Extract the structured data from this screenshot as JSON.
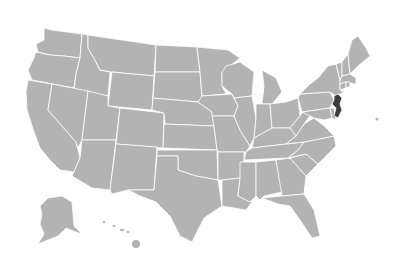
{
  "map": {
    "title": "United States",
    "colors": {
      "base": "#b3b3b3",
      "highlight": "#3d3d3d",
      "border": "#ffffff",
      "background": "#ffffff"
    },
    "highlighted_state": "New Jersey",
    "states": [
      {
        "name": "Washington",
        "points": "44,28 52,30 82,34 80,58 64,56 50,55 38,52 36,44 44,40"
      },
      {
        "name": "Oregon",
        "points": "36,52 50,55 64,56 80,58 76,74 74,88 32,80 28,70 33,60"
      },
      {
        "name": "California",
        "points": "28,80 52,84 48,110 76,142 80,158 74,172 60,170 50,160 40,148 34,132 27,110 26,92"
      },
      {
        "name": "Idaho",
        "points": "82,34 88,35 88,48 96,62 100,70 110,72 108,96 74,90 76,74 80,58"
      },
      {
        "name": "Nevada",
        "points": "52,84 88,91 82,140 78,148 76,142 48,110"
      },
      {
        "name": "Montana",
        "points": "88,35 156,45 154,76 112,72 100,70 96,62 88,48"
      },
      {
        "name": "Wyoming",
        "points": "112,72 154,76 152,110 108,106"
      },
      {
        "name": "Utah",
        "points": "88,91 108,96 108,106 120,108 116,140 82,140"
      },
      {
        "name": "Arizona",
        "points": "82,140 116,140 110,190 92,188 72,176 80,158"
      },
      {
        "name": "Colorado",
        "points": "120,108 164,113 163,148 116,144"
      },
      {
        "name": "New Mexico",
        "points": "116,144 157,147 154,190 128,190 112,194 110,190"
      },
      {
        "name": "North Dakota",
        "points": "156,45 197,47 200,72 155,72"
      },
      {
        "name": "South Dakota",
        "points": "155,72 200,72 202,98 198,102 153,98"
      },
      {
        "name": "Nebraska",
        "points": "153,98 198,102 212,112 214,126 165,124 164,113 152,110"
      },
      {
        "name": "Kansas",
        "points": "164,124 214,126 217,150 163,148"
      },
      {
        "name": "Oklahoma",
        "points": "157,150 217,150 218,180 196,176 178,170 178,156 157,156"
      },
      {
        "name": "Texas",
        "points": "157,156 178,156 178,170 196,176 218,180 222,206 204,218 192,242 180,236 170,216 156,202 140,196 128,190 154,190"
      },
      {
        "name": "Minnesota",
        "points": "197,47 228,50 240,58 222,72 222,86 226,94 202,96 200,72"
      },
      {
        "name": "Iowa",
        "points": "202,96 232,94 238,106 234,116 212,116 212,112 198,102"
      },
      {
        "name": "Missouri",
        "points": "212,116 234,116 240,130 250,146 246,152 218,152 217,150 214,126"
      },
      {
        "name": "Arkansas",
        "points": "218,152 244,152 244,160 240,178 222,180 218,180"
      },
      {
        "name": "Louisiana",
        "points": "222,180 240,178 238,196 252,202 246,210 222,206"
      },
      {
        "name": "Wisconsin",
        "points": "226,66 240,62 254,72 252,96 234,98 232,94 222,86 222,72"
      },
      {
        "name": "Illinois",
        "points": "234,98 252,96 256,118 254,138 250,146 240,130 234,116 238,106"
      },
      {
        "name": "Michigan",
        "points": "262,70 276,78 282,92 272,104 262,104 264,86"
      },
      {
        "name": "Indiana",
        "points": "256,104 270,104 272,128 258,136 254,138 256,118"
      },
      {
        "name": "Ohio",
        "points": "270,104 286,102 298,98 300,116 290,128 272,128"
      },
      {
        "name": "Kentucky",
        "points": "254,138 272,128 290,128 296,136 286,144 252,148"
      },
      {
        "name": "Tennessee",
        "points": "246,152 252,148 286,144 304,142 298,150 288,158 244,160"
      },
      {
        "name": "Mississippi",
        "points": "240,162 256,162 256,196 250,202 238,196 240,178"
      },
      {
        "name": "Alabama",
        "points": "256,162 276,160 282,192 264,196 260,200 256,196"
      },
      {
        "name": "Georgia",
        "points": "276,160 290,158 306,176 304,194 282,196"
      },
      {
        "name": "Florida",
        "points": "262,198 282,196 304,194 314,210 320,236 312,238 300,220 290,206 278,204"
      },
      {
        "name": "South Carolina",
        "points": "290,158 306,154 318,164 306,176"
      },
      {
        "name": "North Carolina",
        "points": "288,158 298,150 304,142 334,136 336,146 318,164 306,154"
      },
      {
        "name": "Virginia",
        "points": "286,144 296,136 304,124 314,118 324,126 334,136 304,142"
      },
      {
        "name": "West Virginia",
        "points": "290,128 300,116 304,110 310,116 304,124 296,136"
      },
      {
        "name": "Pennsylvania",
        "points": "298,98 300,94 330,92 334,100 330,108 302,112"
      },
      {
        "name": "Maryland",
        "points": "302,112 330,108 332,118 324,120 314,118 310,116"
      },
      {
        "name": "Delaware",
        "points": "330,108 334,108 336,120 332,118"
      },
      {
        "name": "New York",
        "points": "300,94 310,84 318,78 328,66 336,64 340,80 340,90 344,92 336,96 330,92"
      },
      {
        "name": "Vermont",
        "points": "336,64 342,62 342,76 340,80"
      },
      {
        "name": "New Hampshire",
        "points": "342,62 348,54 350,74 342,76"
      },
      {
        "name": "Maine",
        "points": "348,54 352,40 358,36 366,48 370,56 358,66 350,74"
      },
      {
        "name": "Massachusetts",
        "points": "340,80 342,76 350,74 356,78 356,84 346,82 340,84"
      },
      {
        "name": "Connecticut",
        "points": "340,84 346,82 346,88 340,90"
      },
      {
        "name": "Rhode Island",
        "points": "346,82 350,82 350,86 346,88"
      },
      {
        "name": "New Jersey",
        "points": "334,96 338,94 342,98 340,104 342,110 338,118 334,116 336,108 332,104 334,100",
        "highlight": true
      }
    ],
    "alaska": "48,198 62,196 72,202 74,226 82,234 76,232 66,228 58,236 48,240 38,244 44,234 40,224 42,214 40,206",
    "hawaii": [
      {
        "cx": 104,
        "cy": 222,
        "rx": 1.5,
        "ry": 1
      },
      {
        "cx": 114,
        "cy": 226,
        "rx": 1.5,
        "ry": 1
      },
      {
        "cx": 122,
        "cy": 230,
        "rx": 2,
        "ry": 1.2
      },
      {
        "cx": 128,
        "cy": 232,
        "rx": 1.5,
        "ry": 1
      },
      {
        "cx": 136,
        "cy": 244,
        "rx": 4,
        "ry": 4
      }
    ]
  }
}
